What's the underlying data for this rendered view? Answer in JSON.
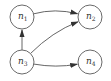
{
  "diagram": {
    "type": "directed-graph",
    "nodes": [
      {
        "id": "n1",
        "base": "n",
        "sub": "1"
      },
      {
        "id": "n2",
        "base": "n",
        "sub": "2"
      },
      {
        "id": "n3",
        "base": "n",
        "sub": "3"
      },
      {
        "id": "n4",
        "base": "n",
        "sub": "4"
      }
    ],
    "edges": [
      {
        "from": "n1",
        "to": "n2"
      },
      {
        "from": "n3",
        "to": "n1"
      },
      {
        "from": "n3",
        "to": "n2"
      },
      {
        "from": "n3",
        "to": "n4"
      }
    ],
    "colors": {
      "node_stroke": "#6a6a6a",
      "edge": "#555555",
      "text": "#333333",
      "background": "#ffffff"
    }
  }
}
